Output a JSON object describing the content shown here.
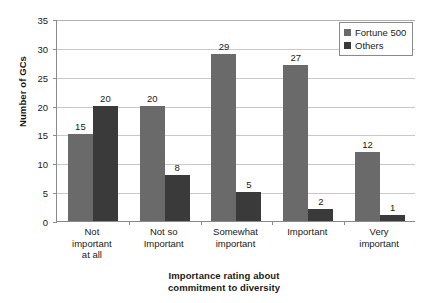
{
  "chart_data": {
    "type": "bar",
    "title": "",
    "xlabel": "Importance rating about commitment to diversity",
    "xlabel_lines": [
      "Importance rating about",
      "commitment to diversity"
    ],
    "ylabel": "Number of GCs",
    "ylim": [
      0,
      35
    ],
    "ytick_step": 5,
    "yticks": [
      0,
      5,
      10,
      15,
      20,
      25,
      30,
      35
    ],
    "ytick_labels": [
      "0",
      "5",
      "10",
      "15",
      "20",
      "25",
      "30",
      "35"
    ],
    "grid": true,
    "grid_axis": "y",
    "legend_position": "top-right",
    "categories": [
      "Not important at all",
      "Not so Important",
      "Somewhat important",
      "Important",
      "Very important"
    ],
    "category_lines": [
      [
        "Not",
        "important",
        "at all"
      ],
      [
        "Not so",
        "Important"
      ],
      [
        "Somewhat",
        "important"
      ],
      [
        "Important"
      ],
      [
        "Very",
        "important"
      ]
    ],
    "series": [
      {
        "name": "Fortune 500",
        "color": "#6a6a6a",
        "values": [
          15,
          20,
          29,
          27,
          12
        ],
        "labels": [
          "15",
          "20",
          "29",
          "27",
          "12"
        ]
      },
      {
        "name": "Others",
        "color": "#3a3a3a",
        "values": [
          20,
          8,
          5,
          2,
          1
        ],
        "labels": [
          "20",
          "8",
          "5",
          "2",
          "1"
        ]
      }
    ]
  },
  "legend": {
    "items": [
      {
        "label": "Fortune 500",
        "color": "#6a6a6a"
      },
      {
        "label": "Others",
        "color": "#3a3a3a"
      }
    ]
  },
  "axes": {
    "y_title": "Number of GCs",
    "x_title_line1": "Importance rating about",
    "x_title_line2": "commitment to diversity"
  },
  "colors": {
    "series_1": "#6a6a6a",
    "series_2": "#3a3a3a",
    "grid": "#c9c9c9",
    "axis": "#8a8a8a",
    "text": "#1a1a1a",
    "background": "#ffffff"
  }
}
